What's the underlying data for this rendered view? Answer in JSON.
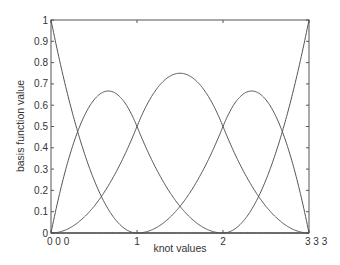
{
  "chart_data": {
    "type": "line",
    "title": "",
    "xlabel": "knot values",
    "ylabel": "basis function value",
    "xlim": [
      0,
      3
    ],
    "ylim": [
      0,
      1
    ],
    "grid": false,
    "legend": null,
    "degree": 2,
    "knots": [
      0,
      0,
      0,
      1,
      2,
      3,
      3,
      3
    ],
    "x_ticks": [
      {
        "value": 0,
        "label": "0 0 0"
      },
      {
        "value": 1,
        "label": "1"
      },
      {
        "value": 2,
        "label": "2"
      },
      {
        "value": 3,
        "label": "3 3 3"
      }
    ],
    "y_ticks": [
      {
        "value": 0,
        "label": "0"
      },
      {
        "value": 0.1,
        "label": "0.1"
      },
      {
        "value": 0.2,
        "label": "0.2"
      },
      {
        "value": 0.3,
        "label": "0.3"
      },
      {
        "value": 0.4,
        "label": "0.4"
      },
      {
        "value": 0.5,
        "label": "0.5"
      },
      {
        "value": 0.6,
        "label": "0.6"
      },
      {
        "value": 0.7,
        "label": "0.7"
      },
      {
        "value": 0.8,
        "label": "0.8"
      },
      {
        "value": 0.9,
        "label": "0.9"
      },
      {
        "value": 1,
        "label": "1"
      }
    ],
    "series": [
      {
        "name": "N0",
        "peak": {
          "x": 0,
          "y": 1
        }
      },
      {
        "name": "N1",
        "peak": {
          "x": 0.667,
          "y": 0.667
        }
      },
      {
        "name": "N2",
        "peak": {
          "x": 1.5,
          "y": 0.75
        }
      },
      {
        "name": "N3",
        "peak": {
          "x": 2.333,
          "y": 0.667
        }
      },
      {
        "name": "N4",
        "peak": {
          "x": 3,
          "y": 1
        }
      }
    ],
    "line_color": "#555555"
  }
}
